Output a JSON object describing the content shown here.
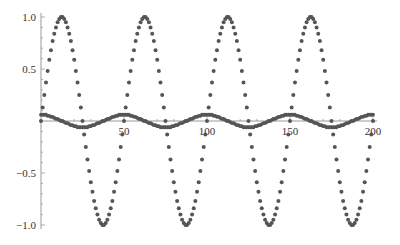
{
  "chart_data": {
    "type": "scatter",
    "title": "",
    "xlabel": "",
    "ylabel": "",
    "xlim": [
      0,
      200
    ],
    "ylim": [
      -1.0,
      1.0
    ],
    "grid": false,
    "legend": null,
    "x_ticks": [
      50,
      100,
      150,
      200
    ],
    "x_tick_labels": [
      "50",
      "100",
      "150",
      "200"
    ],
    "y_ticks": [
      1.0,
      0.5,
      -0.5,
      -1.0
    ],
    "y_tick_labels": [
      "1.0",
      "0.5",
      "−0.5",
      "−1.0"
    ],
    "x_start": 0,
    "x_step": 1,
    "series": [
      {
        "name": "large oscillation",
        "description": "sin(2πx/50), amplitude 1, period ~50",
        "color": "#555555",
        "period_values": [
          0,
          0.13,
          0.25,
          0.37,
          0.48,
          0.59,
          0.68,
          0.77,
          0.84,
          0.9,
          0.95,
          0.98,
          1.0,
          1.0,
          0.98,
          0.95,
          0.9,
          0.84,
          0.77,
          0.68,
          0.59,
          0.48,
          0.37,
          0.25,
          0.13,
          0,
          -0.13,
          -0.25,
          -0.37,
          -0.48,
          -0.59,
          -0.68,
          -0.77,
          -0.84,
          -0.9,
          -0.95,
          -0.98,
          -1.0,
          -1.0,
          -0.98,
          -0.95,
          -0.9,
          -0.84,
          -0.77,
          -0.68,
          -0.59,
          -0.48,
          -0.37,
          -0.25,
          -0.13
        ],
        "repeat_to": 200
      },
      {
        "name": "small oscillation",
        "description": "0.06·cos(2πx/50), amplitude ~0.06, period ~50",
        "color": "#555555",
        "period_values": [
          0.06,
          0.06,
          0.06,
          0.06,
          0.05,
          0.05,
          0.04,
          0.04,
          0.03,
          0.02,
          0.02,
          0.01,
          0.0,
          -0.0,
          -0.01,
          -0.02,
          -0.02,
          -0.03,
          -0.04,
          -0.04,
          -0.05,
          -0.05,
          -0.06,
          -0.06,
          -0.06,
          -0.06,
          -0.06,
          -0.06,
          -0.06,
          -0.05,
          -0.05,
          -0.04,
          -0.04,
          -0.03,
          -0.02,
          -0.02,
          -0.01,
          -0.0,
          0.0,
          0.01,
          0.02,
          0.02,
          0.03,
          0.04,
          0.04,
          0.05,
          0.05,
          0.06,
          0.06,
          0.06
        ],
        "repeat_to": 200
      }
    ]
  },
  "axes": {
    "color": "#999999",
    "label_color": "#333333"
  }
}
